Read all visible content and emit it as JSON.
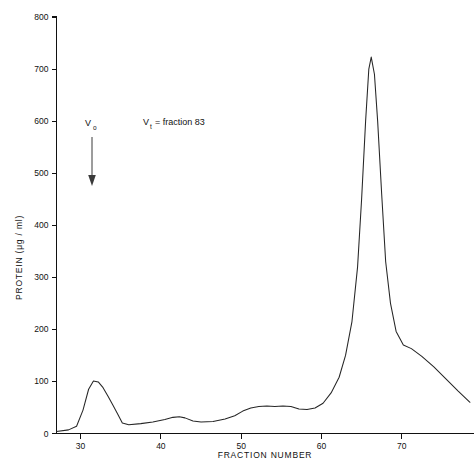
{
  "figure": {
    "background_color": "#ffffff",
    "curve_color": "#262626",
    "axis_color": "#111111"
  },
  "annotations": {
    "void_volume": {
      "label": "V",
      "subscript": "o",
      "arrow": "down-arrow-icon",
      "fraction_position": 34
    },
    "total_volume": {
      "text": "V",
      "subscript": "t",
      "equals_text": "= fraction 83"
    }
  },
  "chart_data": {
    "type": "line",
    "title": "",
    "xlabel": "FRACTION   NUMBER",
    "ylabel": "PROTEIN (μg / ml)",
    "xlim": [
      27,
      79
    ],
    "ylim": [
      0,
      800
    ],
    "xticks": [
      30,
      40,
      50,
      60,
      70
    ],
    "xtick_labels": [
      "30",
      "40",
      "50",
      "60",
      "70"
    ],
    "yticks": [
      0,
      100,
      200,
      300,
      400,
      500,
      600,
      700,
      800
    ],
    "ytick_labels": [
      "0",
      "100",
      "200",
      "300",
      "400",
      "500",
      "600",
      "700",
      "800"
    ],
    "grid": false,
    "legend": "none",
    "series": [
      {
        "name": "Protein elution profile",
        "x": [
          27.0,
          28.5,
          29.5,
          30.3,
          31.0,
          31.6,
          32.2,
          32.8,
          33.4,
          34.0,
          34.6,
          35.2,
          36.0,
          37.5,
          39.0,
          40.5,
          41.5,
          42.3,
          43.0,
          44.0,
          45.0,
          46.5,
          48.0,
          49.2,
          50.2,
          51.2,
          52.2,
          53.2,
          54.2,
          55.2,
          56.2,
          57.2,
          58.2,
          59.2,
          60.2,
          61.2,
          62.2,
          63.0,
          63.8,
          64.5,
          65.0,
          65.5,
          65.9,
          66.2,
          66.6,
          67.0,
          67.5,
          68.0,
          68.6,
          69.3,
          70.2,
          71.2,
          72.5,
          74.0,
          75.5,
          77.0,
          78.5
        ],
        "y": [
          4,
          7,
          14,
          45,
          85,
          101,
          99,
          88,
          72,
          55,
          38,
          20,
          17,
          19,
          22,
          27,
          31,
          32,
          30,
          24,
          22,
          23,
          28,
          34,
          43,
          49,
          52,
          53,
          52,
          53,
          52,
          47,
          46,
          49,
          58,
          78,
          108,
          150,
          215,
          320,
          450,
          600,
          700,
          723,
          690,
          600,
          460,
          330,
          250,
          196,
          170,
          163,
          148,
          128,
          105,
          82,
          60
        ],
        "peaks": [
          {
            "fraction": 31.6,
            "value": 101,
            "label": "void peak"
          },
          {
            "fraction": 66.2,
            "value": 723,
            "label": "main protein peak"
          }
        ]
      }
    ]
  }
}
